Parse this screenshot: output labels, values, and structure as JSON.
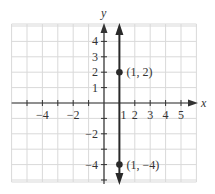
{
  "chart_data": {
    "type": "line",
    "title": "",
    "xlabel": "x",
    "ylabel": "y",
    "xlim": [
      -6,
      6
    ],
    "ylim": [
      -5,
      5
    ],
    "grid": true,
    "x_tick_labels": [
      "-4",
      "-2",
      "1",
      "2",
      "3",
      "4",
      "5"
    ],
    "x_tick_values": [
      -4,
      -2,
      1,
      2,
      3,
      4,
      5
    ],
    "y_tick_labels": [
      "4",
      "3",
      "2",
      "1",
      "-2",
      "-4"
    ],
    "y_tick_values": [
      4,
      3,
      2,
      1,
      -2,
      -4
    ],
    "series": [
      {
        "name": "x = 1",
        "kind": "vertical-line",
        "x": 1,
        "arrows": "both"
      }
    ],
    "points": [
      {
        "x": 1,
        "y": 2,
        "label": "(1, 2)"
      },
      {
        "x": 1,
        "y": -4,
        "label": "(1, −4)"
      }
    ],
    "colors": {
      "grid": "#d9d9d9",
      "axis": "#333333",
      "line": "#2a2a2a"
    }
  }
}
